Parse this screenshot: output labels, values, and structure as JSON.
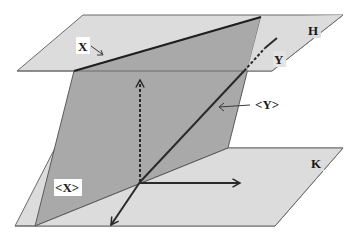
{
  "diagram": {
    "type": "3d-geometry-planes",
    "colors": {
      "background": "#ffffff",
      "plane_light": "#dcdcdc",
      "plane_dark": "#a9a9a9",
      "edge": "#5a5a5a",
      "line": "#2a2a2a",
      "label_bg": "#ffffff"
    },
    "planes": [
      {
        "id": "H",
        "label": "H"
      },
      {
        "id": "K",
        "label": "K"
      },
      {
        "id": "X-plane",
        "label": "<X>"
      }
    ],
    "labels": {
      "H": "H",
      "K": "K",
      "X": "X",
      "Y": "Y",
      "span_X": "<X>",
      "span_Y": "<Y>"
    }
  }
}
